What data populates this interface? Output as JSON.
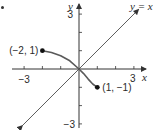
{
  "chart_data": {
    "type": "line",
    "title": "",
    "xlabel": "x",
    "ylabel": "y",
    "xlim": [
      -3,
      3
    ],
    "ylim": [
      -3,
      3
    ],
    "grid": false,
    "x_ticks": [
      -3,
      -2,
      -1,
      1,
      2,
      3
    ],
    "y_ticks": [
      -3,
      -2,
      -1,
      1,
      2,
      3
    ],
    "x_tick_labels": [
      {
        "value": -3,
        "text": "−3"
      },
      {
        "value": 3,
        "text": "3"
      }
    ],
    "y_tick_labels": [
      {
        "value": 3,
        "text": "3"
      },
      {
        "value": -3,
        "text": "−3"
      }
    ],
    "series": [
      {
        "name": "y = x",
        "kind": "reference-line",
        "x": [
          -3,
          3
        ],
        "y": [
          -3,
          3
        ],
        "color": "#333333"
      },
      {
        "name": "curve",
        "kind": "curve",
        "x": [
          -2,
          -1.5,
          -1,
          -0.5,
          0,
          0.25,
          0.5,
          0.75,
          1
        ],
        "y": [
          1,
          0.9,
          0.72,
          0.45,
          0,
          -0.25,
          -0.55,
          -0.82,
          -1
        ],
        "color": "#5a5a5a"
      }
    ],
    "points": [
      {
        "x": -2,
        "y": 1,
        "label": "(−2, 1)"
      },
      {
        "x": 1,
        "y": -1,
        "label": "(1, −1)"
      }
    ],
    "annotations": [
      {
        "text": "y = x",
        "anchor": "top-right"
      }
    ]
  }
}
